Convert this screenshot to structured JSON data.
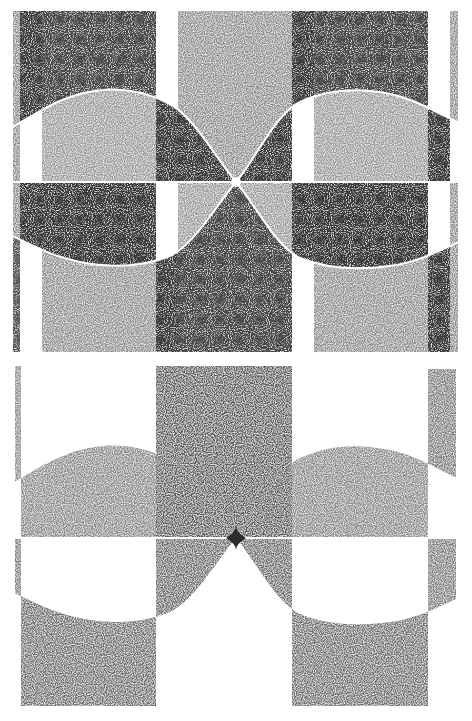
{
  "figure": {
    "panel_count": 2,
    "colors": {
      "background": "#ffffff",
      "dark": "#3a3a3a",
      "medium_dark": "#4e4e4e",
      "light_stipple": "#8a8a8a",
      "lightest_stipple": "#a4a4a4",
      "center_x_bottom": "#2c2c2c"
    },
    "panels": [
      {
        "id": "top",
        "bounds": {
          "x0": 13,
          "y0": 11,
          "x1": 458,
          "y1": 352
        },
        "center_crossing": {
          "x": 236,
          "y": 182
        },
        "mid_line_y": 182
      },
      {
        "id": "bottom",
        "bounds": {
          "x0": 13,
          "y0": 366,
          "x1": 458,
          "y1": 706
        },
        "center_crossing": {
          "x": 236,
          "y": 538
        },
        "mid_line_y": 538
      }
    ],
    "caption": {
      "visible": "partial",
      "text": ""
    }
  }
}
